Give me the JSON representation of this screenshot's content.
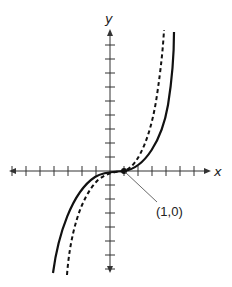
{
  "graph": {
    "x_axis_label": "x",
    "y_axis_label": "y",
    "point_label": "(1,0)",
    "colors": {
      "axis": "#333333",
      "curve": "#111111",
      "leader": "#444444",
      "background": "#ffffff"
    },
    "origin_px": [
      110,
      171
    ],
    "tick_spacing_px": 14,
    "x_ticks": [
      -7,
      -6,
      -5,
      -4,
      -3,
      -2,
      -1,
      1,
      2,
      3,
      4,
      5,
      6
    ],
    "y_ticks": [
      -7,
      -6,
      -5,
      -4,
      -3,
      -2,
      -1,
      1,
      2,
      3,
      4,
      5,
      6,
      7,
      8,
      9
    ],
    "curves": [
      {
        "name": "solid-curve",
        "style": "solid"
      },
      {
        "name": "dashed-curve",
        "style": "dashed"
      }
    ],
    "marked_point": {
      "x": 1,
      "y": 0
    }
  }
}
